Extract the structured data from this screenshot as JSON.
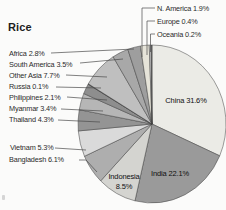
{
  "page": {
    "title": "Rice",
    "background": "#fbfbfa"
  },
  "chart_data": {
    "type": "pie",
    "title": "Rice",
    "unit": "%",
    "total": 100.0,
    "start_angle_deg": 0,
    "direction": "clockwise",
    "legend_position": "callout-labels",
    "grid": false,
    "palette_style": "grayscale-print",
    "slices": [
      {
        "label": "China",
        "value": 31.6,
        "display": "China 31.6%",
        "color": "#ebebe6",
        "callout": {
          "placement": "inside",
          "x": 186,
          "y": 96,
          "anchor": "center"
        }
      },
      {
        "label": "India",
        "value": 22.1,
        "display": "India 22.1%",
        "color": "#9a9a9a",
        "callout": {
          "placement": "inside",
          "x": 170,
          "y": 169,
          "anchor": "center"
        }
      },
      {
        "label": "Indonesia",
        "value": 8.5,
        "display": "Indonesia 8.5%",
        "color": "#d4d4d0",
        "display_lines": [
          "Indonesia",
          "8.5%"
        ],
        "callout": {
          "placement": "inside",
          "x": 124,
          "y": 172,
          "anchor": "center"
        }
      },
      {
        "label": "Bangladesh",
        "value": 6.1,
        "display": "Bangladesh 6.1%",
        "color": "#aeaeae",
        "callout": {
          "placement": "outside",
          "x": 9,
          "y": 155,
          "anchor": "left",
          "leader": [
            [
              79,
              160
            ],
            [
              86,
              160
            ],
            [
              97,
              172
            ]
          ]
        }
      },
      {
        "label": "Vietnam",
        "value": 5.3,
        "display": "Vietnam 5.3%",
        "color": "#dadada",
        "callout": {
          "placement": "outside",
          "x": 10,
          "y": 143,
          "anchor": "left",
          "leader": [
            [
              55,
              148
            ],
            [
              86,
              150
            ]
          ]
        }
      },
      {
        "label": "Thailand",
        "value": 4.3,
        "display": "Thailand 4.3%",
        "color": "#949494",
        "callout": {
          "placement": "outside",
          "x": 9,
          "y": 115,
          "anchor": "left",
          "leader": [
            [
              58,
              120
            ],
            [
              100,
              122
            ]
          ]
        }
      },
      {
        "label": "Myanmar",
        "value": 3.4,
        "display": "Myanmar 3.4%",
        "color": "#b6b6b6",
        "callout": {
          "placement": "outside",
          "x": 9,
          "y": 104,
          "anchor": "left",
          "leader": [
            [
              61,
              109
            ],
            [
              103,
              111
            ]
          ]
        }
      },
      {
        "label": "Philippines",
        "value": 2.1,
        "display": "Philippines 2.1%",
        "color": "#8e8e8e",
        "callout": {
          "placement": "outside",
          "x": 9,
          "y": 93,
          "anchor": "left",
          "leader": [
            [
              67,
              97
            ],
            [
              107,
              100
            ]
          ]
        }
      },
      {
        "label": "Russia",
        "value": 0.1,
        "display": "Russia 0.1%",
        "color": "#555555",
        "callout": {
          "placement": "outside",
          "x": 9,
          "y": 82,
          "anchor": "left",
          "leader": [
            [
              56,
              87
            ],
            [
              101,
              88
            ]
          ]
        }
      },
      {
        "label": "Other Asia",
        "value": 7.7,
        "display": "Other Asia 7.7%",
        "color": "#bfbfbf",
        "callout": {
          "placement": "outside",
          "x": 9,
          "y": 71,
          "anchor": "left",
          "leader": [
            [
              66,
              75
            ],
            [
              107,
              77
            ]
          ]
        }
      },
      {
        "label": "South America",
        "value": 3.5,
        "display": "South America 3.5%",
        "color": "#a8a8a8",
        "callout": {
          "placement": "outside",
          "x": 9,
          "y": 60,
          "anchor": "left",
          "leader": [
            [
              80,
              63
            ],
            [
              123,
              59
            ]
          ]
        }
      },
      {
        "label": "Africa",
        "value": 2.8,
        "display": "Africa 2.8%",
        "color": "#9e9e9e",
        "callout": {
          "placement": "outside",
          "x": 9,
          "y": 49,
          "anchor": "left",
          "leader": [
            [
              51,
              53
            ],
            [
              134,
              49
            ]
          ]
        }
      },
      {
        "label": "N. America",
        "value": 1.9,
        "display": "N. America 1.9%",
        "color": "#e6e4d9",
        "callout": {
          "placement": "outside",
          "x": 157,
          "y": 4,
          "anchor": "left",
          "leader": [
            [
              155,
              8
            ],
            [
              142,
              8
            ],
            [
              142,
              57
            ]
          ]
        }
      },
      {
        "label": "Europe",
        "value": 0.4,
        "display": "Europe 0.4%",
        "color": "#dcdcdc",
        "callout": {
          "placement": "outside",
          "x": 157,
          "y": 17,
          "anchor": "left",
          "leader": [
            [
              155,
              21
            ],
            [
              147,
              21
            ],
            [
              147,
              55
            ]
          ]
        }
      },
      {
        "label": "Oceania",
        "value": 0.2,
        "display": "Oceania 0.2%",
        "color": "#6f6f6f",
        "callout": {
          "placement": "outside",
          "x": 157,
          "y": 30,
          "anchor": "left",
          "leader": [
            [
              155,
              34
            ],
            [
              150.5,
              34
            ],
            [
              150.5,
              52
            ]
          ]
        }
      }
    ],
    "layout": {
      "pie": {
        "cx": 152,
        "cy": 124,
        "rx": 74,
        "ry": 79,
        "slice_stroke": "#3f3f3f",
        "slice_stroke_width": 0.5,
        "leader_stroke": "#4a4a4a",
        "leader_stroke_width": 0.7
      }
    }
  }
}
